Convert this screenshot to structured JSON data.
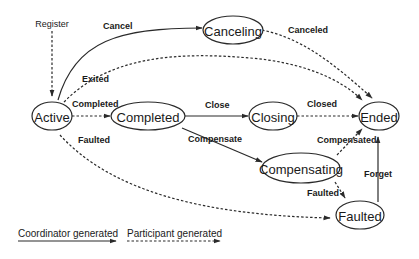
{
  "diagram": {
    "type": "state-machine",
    "nodes": {
      "active": "Active",
      "completed": "Completed",
      "closing": "Closing",
      "ended": "Ended",
      "canceling": "Canceling",
      "compensating": "Compensating",
      "faulted": "Faulted"
    },
    "entry_label": "Register",
    "edges": {
      "register": "Register",
      "cancel": "Cancel",
      "canceled": "Canceled",
      "exited": "Exited",
      "completed": "Completed",
      "close": "Close",
      "closed": "Closed",
      "compensate": "Compensate",
      "compensated": "Compensated",
      "faulted_active": "Faulted",
      "faulted_compensating": "Faulted",
      "forget": "Forget"
    },
    "transitions": [
      {
        "from": "Register",
        "to": "Active",
        "label": "",
        "style": "participant"
      },
      {
        "from": "Active",
        "to": "Canceling",
        "label": "Cancel",
        "style": "coordinator"
      },
      {
        "from": "Canceling",
        "to": "Ended",
        "label": "Canceled",
        "style": "participant"
      },
      {
        "from": "Active",
        "to": "Ended",
        "label": "Exited",
        "style": "participant"
      },
      {
        "from": "Active",
        "to": "Completed",
        "label": "Completed",
        "style": "participant"
      },
      {
        "from": "Completed",
        "to": "Closing",
        "label": "Close",
        "style": "coordinator"
      },
      {
        "from": "Closing",
        "to": "Ended",
        "label": "Closed",
        "style": "participant"
      },
      {
        "from": "Completed",
        "to": "Compensating",
        "label": "Compensate",
        "style": "coordinator"
      },
      {
        "from": "Compensating",
        "to": "Ended",
        "label": "Compensated",
        "style": "participant"
      },
      {
        "from": "Compensating",
        "to": "Faulted",
        "label": "Faulted",
        "style": "participant"
      },
      {
        "from": "Active",
        "to": "Faulted",
        "label": "Faulted",
        "style": "participant"
      },
      {
        "from": "Faulted",
        "to": "Ended",
        "label": "Forget",
        "style": "coordinator"
      }
    ],
    "legend": {
      "coordinator": "Coordinator generated",
      "participant": "Participant generated"
    }
  }
}
